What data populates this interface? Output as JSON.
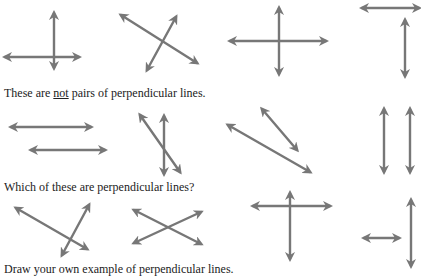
{
  "captions": {
    "not_pairs_prefix": "These are ",
    "not_pairs_emph": "not",
    "not_pairs_suffix": " pairs of perpendicular lines.",
    "which": "Which of these are perpendicular lines?",
    "draw": "Draw your own example of perpendicular lines."
  },
  "colors": {
    "line": "#777777",
    "text": "#222222"
  },
  "rows": [
    {
      "name": "perpendicular-examples",
      "figures": [
        {
          "lines": [
            [
              5,
              57,
              79,
              57
            ],
            [
              54,
              13,
              54,
              68
            ]
          ]
        },
        {
          "lines": [
            [
              121,
              15,
              197,
              63
            ],
            [
              176,
              17,
              147,
              70
            ]
          ]
        },
        {
          "lines": [
            [
              230,
              41,
              326,
              41
            ],
            [
              279,
              8,
              279,
              74
            ]
          ]
        },
        {
          "lines": [
            [
              362,
              8,
              419,
              8
            ],
            [
              405,
              20,
              405,
              76
            ]
          ]
        }
      ]
    },
    {
      "name": "not-perpendicular-examples",
      "figures": [
        {
          "lines": [
            [
              11,
              127,
              91,
              127
            ],
            [
              31,
              150,
              105,
              150
            ]
          ]
        },
        {
          "lines": [
            [
              164,
              116,
              164,
              174
            ],
            [
              140,
              115,
              180,
              172
            ]
          ]
        },
        {
          "lines": [
            [
              228,
              125,
              310,
              172
            ],
            [
              262,
              109,
              297,
              150
            ]
          ]
        },
        {
          "lines": [
            [
              384,
              109,
              384,
              172
            ],
            [
              410,
              109,
              410,
              172
            ]
          ]
        }
      ]
    },
    {
      "name": "which-are-perpendicular",
      "figures": [
        {
          "lines": [
            [
              16,
              208,
              87,
              249
            ],
            [
              89,
              205,
              62,
              255
            ]
          ]
        },
        {
          "lines": [
            [
              134,
              210,
              201,
              244
            ],
            [
              201,
              212,
              134,
              243
            ]
          ]
        },
        {
          "lines": [
            [
              253,
              206,
              330,
              206
            ],
            [
              290,
              193,
              290,
              259
            ]
          ]
        },
        {
          "lines": [
            [
              364,
              238,
              399,
              238
            ],
            [
              411,
              200,
              411,
              266
            ]
          ]
        }
      ]
    }
  ]
}
